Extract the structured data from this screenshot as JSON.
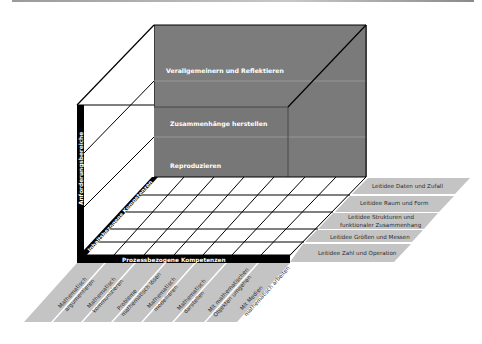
{
  "diagram": {
    "title": "",
    "levels": {
      "axis_label": "Anforderungsbereiche",
      "items": [
        "Verallgemeinern und Reflektieren",
        "Zusammenhänge herstellen",
        "Reproduzieren"
      ]
    },
    "content_competencies": {
      "axis_label": "Inhaltsbezogene Kompetenzen",
      "items": [
        "Leitidee Daten und Zufall",
        "Leitidee Raum und Form",
        "Leitidee Strukturen und",
        "funktionaler Zusammenhang",
        "Leitidee Größen und Messen",
        "Leitidee Zahl und Operation"
      ]
    },
    "process_competencies": {
      "axis_label": "Prozessbezogene Kompetenzen",
      "items": [
        [
          "Mathematisch",
          "argumentieren"
        ],
        [
          "Mathematisch",
          "kommunizieren"
        ],
        [
          "Probleme",
          "mathematisch lösen"
        ],
        [
          "Mathematisch",
          "modellieren"
        ],
        [
          "Mathematisch",
          "darstellen"
        ],
        [
          "Mit mathematischen",
          "Objekten umgehen"
        ],
        [
          "Mit Medien",
          "mathematisch arbeiten"
        ]
      ]
    },
    "colors": {
      "cube_face": "#7a7a7a",
      "side_labels": "#c4c4c4",
      "axis_bar": "#000000",
      "grid_line": "#000000"
    }
  }
}
